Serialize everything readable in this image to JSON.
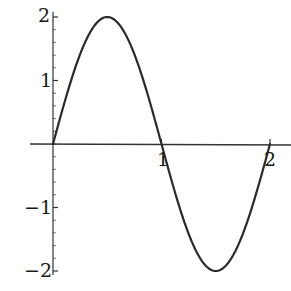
{
  "chart_data": {
    "type": "line",
    "title": "",
    "xlabel": "",
    "ylabel": "",
    "function": "y = 2 sin(pi x)",
    "xlim": [
      -0.21,
      2.2
    ],
    "ylim": [
      -2.1,
      2.1
    ],
    "grid": false,
    "legend": null,
    "x_ticks": [
      1,
      2
    ],
    "x_tick_labels": [
      "1",
      "2"
    ],
    "y_ticks": [
      2,
      1,
      -1,
      -2
    ],
    "y_tick_labels": [
      "2",
      "1",
      "−1",
      "−2"
    ],
    "y_minor_ticks_per_unit": 5,
    "series": [
      {
        "name": "2 sin(πx)",
        "color": "#2a2a2a",
        "x": [
          0,
          0.1,
          0.2,
          0.3,
          0.4,
          0.5,
          0.6,
          0.7,
          0.8,
          0.9,
          1.0,
          1.1,
          1.2,
          1.3,
          1.4,
          1.5,
          1.6,
          1.7,
          1.8,
          1.9,
          2.0
        ],
        "y": [
          0,
          0.618,
          1.176,
          1.618,
          1.902,
          2.0,
          1.902,
          1.618,
          1.176,
          0.618,
          0,
          -0.618,
          -1.176,
          -1.618,
          -1.902,
          -2.0,
          -1.902,
          -1.618,
          -1.176,
          -0.618,
          0
        ]
      }
    ]
  },
  "labels": {
    "y_2": "2",
    "y_1": "1",
    "y_m1": "−1",
    "y_m2": "−2",
    "x_1": "1",
    "x_2": "2"
  },
  "colors": {
    "axis": "#333333",
    "curve": "#2a2a2a",
    "background": "#ffffff"
  }
}
